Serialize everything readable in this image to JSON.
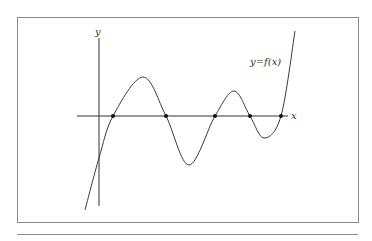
{
  "figure": {
    "y_axis_label": "y",
    "x_axis_label": "x",
    "curve_label": "y=f(x)",
    "colors": {
      "frame": "#8a8a8a",
      "axis": "#333333",
      "curve": "#3a3a3a",
      "rule": "#8a8a8a",
      "point": "#111111"
    }
  },
  "chart_data": {
    "type": "line",
    "title": "",
    "xlabel": "x",
    "ylabel": "y",
    "curve_label": "y=f(x)",
    "roots_px": [
      113,
      166,
      215,
      250,
      281
    ],
    "y_intercept_px": [
      99,
      158
    ],
    "extrema_px": [
      [
        143,
        77
      ],
      [
        189,
        165
      ],
      [
        234,
        91
      ],
      [
        264,
        138
      ]
    ],
    "grid": false,
    "legend": false
  }
}
